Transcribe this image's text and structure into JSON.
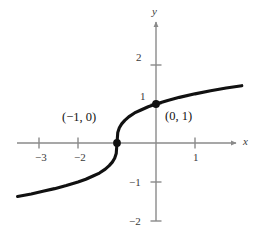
{
  "figure": {
    "kind": "cartesian-graph",
    "background": "#ffffff",
    "curve_color": "#111111",
    "axis_color": "#8a8a8a",
    "text_color": "#262626"
  },
  "axes": {
    "x_axis_label": "x",
    "y_axis_label": "y",
    "x_ticks": [
      {
        "value": -3,
        "label": "−3"
      },
      {
        "value": -2,
        "label": "−2"
      },
      {
        "value": 1,
        "label": "1"
      }
    ],
    "y_ticks": [
      {
        "value": 2,
        "label": "2"
      },
      {
        "value": 1,
        "label": "1"
      },
      {
        "value": -1,
        "label": "−1"
      },
      {
        "value": -2,
        "label": "−2"
      }
    ]
  },
  "annotations": [
    {
      "name": "x-intercept-label",
      "label": "(−1, 0)",
      "point": [
        -1,
        0
      ]
    },
    {
      "name": "y-intercept-label",
      "label": "(0, 1)",
      "point": [
        0,
        1
      ]
    }
  ],
  "chart_data": {
    "type": "line",
    "title": "",
    "xlabel": "x",
    "ylabel": "y",
    "grid": false,
    "legend": null,
    "xlim": [
      -3.55,
      2.2
    ],
    "ylim": [
      -2.6,
      2.6
    ],
    "xticks": [
      -3,
      -2,
      1
    ],
    "yticks": [
      2,
      1,
      -1,
      -2
    ],
    "series": [
      {
        "name": "y = cbrt(x + 1)",
        "equation": "y = ∛(x + 1)",
        "x": [
          -3.55,
          -3.2,
          -2.9,
          -2.6,
          -2.3,
          -2.0,
          -1.8,
          -1.6,
          -1.45,
          -1.3,
          -1.2,
          -1.12,
          -1.06,
          -1.02,
          -1.0,
          -0.98,
          -0.94,
          -0.88,
          -0.8,
          -0.7,
          -0.55,
          -0.4,
          -0.2,
          0.0,
          0.3,
          0.6,
          1.0,
          1.4,
          1.8,
          2.2
        ],
        "y": [
          -1.37,
          -1.31,
          -1.24,
          -1.17,
          -1.09,
          -1.0,
          -0.93,
          -0.84,
          -0.77,
          -0.67,
          -0.58,
          -0.49,
          -0.39,
          -0.27,
          0.0,
          0.27,
          0.39,
          0.49,
          0.58,
          0.67,
          0.77,
          0.84,
          0.93,
          1.0,
          1.09,
          1.17,
          1.26,
          1.34,
          1.41,
          1.47
        ]
      }
    ],
    "points": [
      {
        "label": "(−1, 0)",
        "x": -1,
        "y": 0,
        "marker": "filled-circle"
      },
      {
        "label": "(0, 1)",
        "x": 0,
        "y": 1,
        "marker": "filled-circle"
      }
    ]
  }
}
